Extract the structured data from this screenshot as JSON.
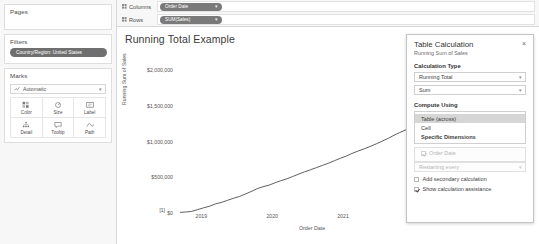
{
  "left_panel": {
    "pages": {
      "title": "Pages"
    },
    "filters": {
      "title": "Filters",
      "pills": [
        {
          "label": "Country/Region: United States"
        }
      ]
    },
    "marks": {
      "title": "Marks",
      "mark_type": "Automatic",
      "buttons": [
        {
          "label": "Color",
          "icon": "color-icon"
        },
        {
          "label": "Size",
          "icon": "size-icon"
        },
        {
          "label": "Label",
          "icon": "label-icon"
        },
        {
          "label": "Detail",
          "icon": "detail-icon"
        },
        {
          "label": "Tooltip",
          "icon": "tooltip-icon"
        },
        {
          "label": "Path",
          "icon": "path-icon"
        }
      ]
    }
  },
  "shelves": [
    {
      "name": "columns",
      "label": "Columns",
      "pill": "Order Date"
    },
    {
      "name": "rows",
      "label": "Rows",
      "pill": "SUM(Sales)"
    }
  ],
  "chart_data": {
    "type": "line",
    "title": "Running Total Example",
    "xlabel": "Order Date",
    "ylabel": "Running Sum of Sales",
    "x_ticks": [
      "2019",
      "2020",
      "2021",
      "2022",
      "2023"
    ],
    "y_ticks": [
      "$2,000,000",
      "$1,500,000",
      "$1,000,000",
      "$500,000",
      "$0"
    ],
    "ylim": [
      0,
      2300000
    ],
    "xlim": [
      2018.6,
      2023.4
    ],
    "grid": false,
    "legend": "none",
    "annotations": [
      {
        "text": "[1,224]",
        "x": 2023.05,
        "y": 2180000
      },
      {
        "text": "[1,189]",
        "x": 2022.95,
        "y": 2075000
      },
      {
        "text": "[1]",
        "x": 2018.72,
        "y": 30000
      }
    ],
    "series": [
      {
        "name": "Running Sum of Sales",
        "color": "#4d4d4d",
        "x": [
          2018.7,
          2018.78,
          2018.86,
          2018.95,
          2019.03,
          2019.12,
          2019.2,
          2019.29,
          2019.37,
          2019.45,
          2019.54,
          2019.62,
          2019.7,
          2019.79,
          2019.87,
          2019.96,
          2020.04,
          2020.12,
          2020.21,
          2020.29,
          2020.38,
          2020.46,
          2020.54,
          2020.63,
          2020.71,
          2020.8,
          2020.88,
          2020.96,
          2021.05,
          2021.13,
          2021.22,
          2021.3,
          2021.38,
          2021.47,
          2021.55,
          2021.64,
          2021.72,
          2021.8,
          2021.89,
          2021.97,
          2022.06,
          2022.14,
          2022.22,
          2022.31,
          2022.39,
          2022.48,
          2022.56,
          2022.64,
          2022.73,
          2022.81,
          2022.9,
          2022.98,
          2023.06
        ],
        "y": [
          9000,
          14000,
          22000,
          48000,
          72000,
          96000,
          128000,
          150000,
          178000,
          205000,
          232000,
          266000,
          300000,
          342000,
          368000,
          392000,
          424000,
          452000,
          480000,
          512000,
          548000,
          578000,
          606000,
          638000,
          668000,
          700000,
          734000,
          766000,
          800000,
          836000,
          872000,
          900000,
          932000,
          970000,
          1006000,
          1048000,
          1090000,
          1128000,
          1168000,
          1208000,
          1256000,
          1300000,
          1348000,
          1404000,
          1444000,
          1486000,
          1540000,
          1596000,
          1650000,
          1712000,
          1790000,
          1882000,
          2010000
        ]
      }
    ]
  },
  "dialog": {
    "title": "Table Calculation",
    "subtitle": "Running Sum of Sales",
    "close_label": "×",
    "calculation_type_head": "Calculation Type",
    "calculation_type": "Running Total",
    "aggregation": "Sum",
    "compute_using_head": "Compute Using",
    "compute_options": [
      {
        "label": "Table (across)",
        "selected": true,
        "bold": false
      },
      {
        "label": "Cell",
        "selected": false,
        "bold": false
      },
      {
        "label": "Specific Dimensions",
        "selected": false,
        "bold": true
      }
    ],
    "dimension": "Order Date",
    "restarting_every": "Restarting every",
    "secondary_calc": {
      "label": "Add secondary calculation",
      "checked": false
    },
    "assistance": {
      "label": "Show calculation assistance",
      "checked": true
    }
  }
}
